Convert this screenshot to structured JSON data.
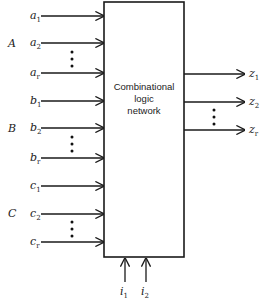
{
  "diagram": {
    "block": {
      "lines": [
        "Combinational",
        "logic",
        "network"
      ]
    },
    "input_groups": [
      {
        "name": "A",
        "inputs": [
          {
            "v": "a",
            "s": "1"
          },
          {
            "v": "a",
            "s": "2"
          },
          {
            "v": "a",
            "s": "r"
          }
        ]
      },
      {
        "name": "B",
        "inputs": [
          {
            "v": "b",
            "s": "1"
          },
          {
            "v": "b",
            "s": "2"
          },
          {
            "v": "b",
            "s": "r"
          }
        ]
      },
      {
        "name": "C",
        "inputs": [
          {
            "v": "c",
            "s": "1"
          },
          {
            "v": "c",
            "s": "2"
          },
          {
            "v": "c",
            "s": "r"
          }
        ]
      }
    ],
    "outputs": [
      {
        "v": "z",
        "s": "1"
      },
      {
        "v": "z",
        "s": "2"
      },
      {
        "v": "z",
        "s": "r"
      }
    ],
    "control_inputs": [
      {
        "v": "i",
        "s": "1"
      },
      {
        "v": "i",
        "s": "2"
      }
    ],
    "ellipsis": "⋮"
  }
}
